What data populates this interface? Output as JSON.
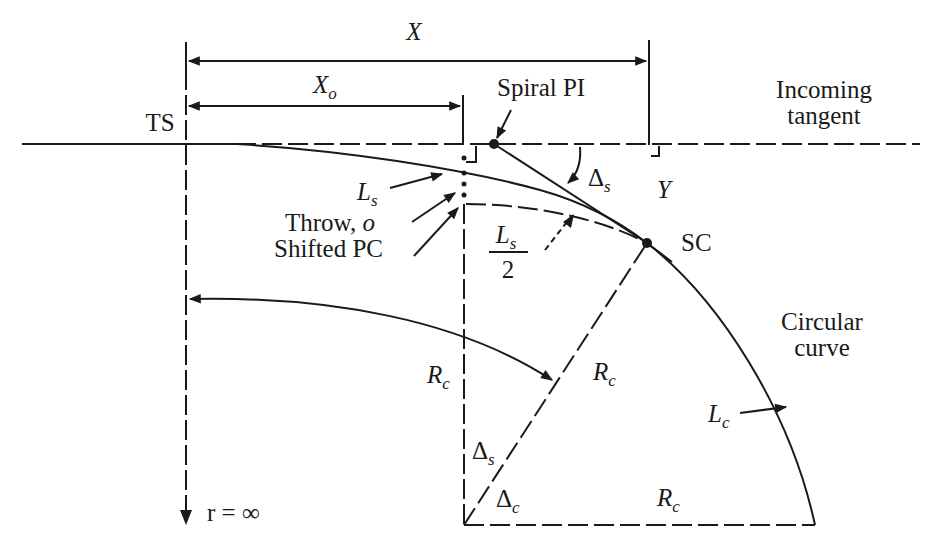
{
  "diagram": {
    "labels": {
      "X": "X",
      "Xo_main": "X",
      "Xo_sub": "o",
      "spiral_pi": "Spiral PI",
      "incoming_tangent_line1": "Incoming",
      "incoming_tangent_line2": "tangent",
      "ts": "TS",
      "ls_main": "L",
      "ls_sub": "s",
      "delta_s_main": "Δ",
      "delta_s_sub": "s",
      "y": "Y",
      "throw": "Throw, ",
      "throw_o": "o",
      "shifted_pc": "Shifted PC",
      "ls_half_num_main": "L",
      "ls_half_num_sub": "s",
      "ls_half_den": "2",
      "sc": "SC",
      "circular_curve_line1": "Circular",
      "circular_curve_line2": "curve",
      "rc_left_main": "R",
      "rc_left_sub": "c",
      "rc_diag_main": "R",
      "rc_diag_sub": "c",
      "lc_main": "L",
      "lc_sub": "c",
      "delta_s_lower_main": "Δ",
      "delta_s_lower_sub": "s",
      "delta_c_main": "Δ",
      "delta_c_sub": "c",
      "rc_bottom_main": "R",
      "rc_bottom_sub": "c",
      "r_infinity": "r = ∞"
    },
    "colors": {
      "ink": "#1a1a1a",
      "background": "#ffffff"
    }
  }
}
